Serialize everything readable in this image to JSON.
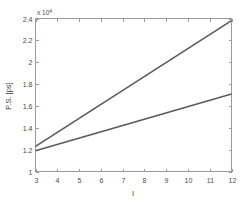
{
  "chart_data": {
    "type": "line",
    "title": "",
    "subtitle": "",
    "xlabel": "l",
    "ylabel": "P.S. [ps]",
    "y_multiplier": "x 10",
    "y_multiplier_exponent": "4",
    "xlim": [
      3,
      12
    ],
    "ylim": [
      10000,
      24000
    ],
    "xticks": [
      3,
      4,
      5,
      6,
      7,
      8,
      9,
      10,
      11,
      12
    ],
    "xticklabels": [
      "3",
      "4",
      "5",
      "6",
      "7",
      "8",
      "9",
      "10",
      "11",
      "12"
    ],
    "yticks": [
      10000,
      12000,
      14000,
      16000,
      18000,
      20000,
      22000,
      24000
    ],
    "yticklabels": [
      "1",
      "1.2",
      "1.4",
      "1.6",
      "1.8",
      "2",
      "2.2",
      "2.4"
    ],
    "grid": false,
    "legend": null,
    "series": [
      {
        "name": "upper",
        "color": "#5a5a5a",
        "x": [
          3,
          12
        ],
        "values": [
          12300,
          23800
        ]
      },
      {
        "name": "lower",
        "color": "#5a5a5a",
        "x": [
          3,
          12
        ],
        "values": [
          11900,
          17100
        ]
      }
    ]
  },
  "figure": {
    "background": "#ffffff",
    "axis_color": "#9a9a9a",
    "text_color": "#4a4a4a"
  }
}
